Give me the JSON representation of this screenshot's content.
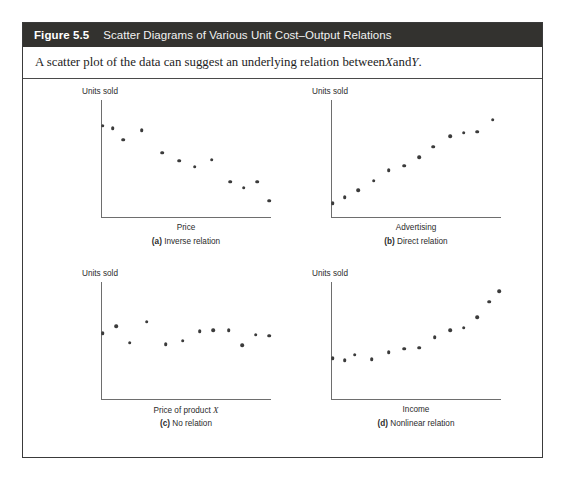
{
  "figure": {
    "number_label": "Figure 5.5",
    "title": "Scatter Diagrams of Various Unit Cost–Output Relations",
    "subtitle_before": "A scatter plot of the data can suggest an underlying relation between ",
    "subtitle_var_x": "X",
    "subtitle_between": " and ",
    "subtitle_var_y": "Y",
    "subtitle_after": ".",
    "header_bg": "#33322f",
    "border_color": "#3a3a3a",
    "dot_color": "#3b3b3b",
    "axis_color": "#6e6e6e"
  },
  "panels": [
    {
      "id": "a",
      "caption_letter": "(a)",
      "caption_text": " Inverse relation",
      "ylabel": "Units sold",
      "xlabel": "Price",
      "xlabel_var": ""
    },
    {
      "id": "b",
      "caption_letter": "(b)",
      "caption_text": " Direct relation",
      "ylabel": "Units sold",
      "xlabel": "Advertising",
      "xlabel_var": ""
    },
    {
      "id": "c",
      "caption_letter": "(c)",
      "caption_text": " No relation",
      "ylabel": "Units sold",
      "xlabel": "Price of product ",
      "xlabel_var": "X"
    },
    {
      "id": "d",
      "caption_letter": "(d)",
      "caption_text": " Nonlinear relation",
      "ylabel": "Units sold",
      "xlabel": "Income",
      "xlabel_var": ""
    }
  ],
  "chart_data": [
    {
      "type": "scatter",
      "title": "(a) Inverse relation",
      "xlabel": "Price",
      "ylabel": "Units sold",
      "xlim": [
        0,
        100
      ],
      "ylim": [
        0,
        100
      ],
      "grid": false,
      "legend": "none",
      "points": [
        [
          1,
          78
        ],
        [
          7,
          76
        ],
        [
          13,
          66
        ],
        [
          24,
          74
        ],
        [
          36,
          55
        ],
        [
          46,
          48
        ],
        [
          55,
          43
        ],
        [
          65,
          49
        ],
        [
          76,
          30
        ],
        [
          84,
          25
        ],
        [
          92,
          30
        ],
        [
          99,
          14
        ]
      ]
    },
    {
      "type": "scatter",
      "title": "(b) Direct relation",
      "xlabel": "Advertising",
      "ylabel": "Units sold",
      "xlim": [
        0,
        100
      ],
      "ylim": [
        0,
        100
      ],
      "grid": false,
      "legend": "none",
      "points": [
        [
          1,
          12
        ],
        [
          8,
          17
        ],
        [
          16,
          23
        ],
        [
          25,
          31
        ],
        [
          34,
          40
        ],
        [
          43,
          44
        ],
        [
          52,
          51
        ],
        [
          60,
          60
        ],
        [
          70,
          69
        ],
        [
          78,
          72
        ],
        [
          86,
          73
        ],
        [
          95,
          83
        ]
      ]
    },
    {
      "type": "scatter",
      "title": "(c) No relation",
      "xlabel": "Price of product X",
      "ylabel": "Units sold",
      "xlim": [
        0,
        100
      ],
      "ylim": [
        0,
        100
      ],
      "grid": false,
      "legend": "none",
      "points": [
        [
          1,
          56
        ],
        [
          9,
          62
        ],
        [
          17,
          48
        ],
        [
          27,
          66
        ],
        [
          38,
          47
        ],
        [
          48,
          50
        ],
        [
          58,
          58
        ],
        [
          66,
          59
        ],
        [
          75,
          59
        ],
        [
          83,
          46
        ],
        [
          91,
          55
        ],
        [
          99,
          54
        ]
      ]
    },
    {
      "type": "scatter",
      "title": "(d) Nonlinear relation",
      "xlabel": "Income",
      "ylabel": "Units sold",
      "xlim": [
        0,
        100
      ],
      "ylim": [
        0,
        100
      ],
      "grid": false,
      "legend": "none",
      "points": [
        [
          1,
          35
        ],
        [
          8,
          33
        ],
        [
          14,
          38
        ],
        [
          24,
          34
        ],
        [
          34,
          40
        ],
        [
          43,
          43
        ],
        [
          52,
          44
        ],
        [
          61,
          53
        ],
        [
          70,
          59
        ],
        [
          78,
          61
        ],
        [
          86,
          70
        ],
        [
          93,
          83
        ],
        [
          99,
          92
        ]
      ]
    }
  ]
}
